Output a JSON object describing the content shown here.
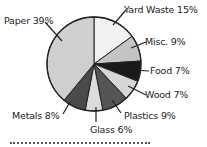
{
  "chart_data": {
    "type": "pie",
    "title": "",
    "categories": [
      "Yard Waste",
      "Misc.",
      "Food",
      "Wood",
      "Plastics",
      "Glass",
      "Metals",
      "Paper"
    ],
    "values": [
      15,
      9,
      7,
      7,
      9,
      6,
      8,
      39
    ],
    "colors": [
      "#f2f2f2",
      "#c4c4c4",
      "#1a1a1a",
      "#d6d6d6",
      "#555555",
      "#dcdcdc",
      "#4a4a4a",
      "#cfcfcf"
    ],
    "start_angle_deg": 0,
    "direction": "clockwise",
    "legend": "none",
    "labels": [
      "Yard Waste 15%",
      "Misc. 9%",
      "Food 7%",
      "Wood 7%",
      "Plastics 9%",
      "Glass 6%",
      "Metals 8%",
      "Paper 39%"
    ]
  },
  "geometry": {
    "cx": 94,
    "cy": 64,
    "r": 47
  },
  "label_positions": [
    {
      "x": 124,
      "y": 4,
      "lx1": 113,
      "ly1": 25,
      "lx2": 126,
      "ly2": 10
    },
    {
      "x": 145,
      "y": 36,
      "lx1": 131,
      "ly1": 48,
      "lx2": 146,
      "ly2": 42
    },
    {
      "x": 150,
      "y": 65,
      "lx1": 133,
      "ly1": 70,
      "lx2": 149,
      "ly2": 71
    },
    {
      "x": 145,
      "y": 89,
      "lx1": 128,
      "ly1": 86,
      "lx2": 146,
      "ly2": 95
    },
    {
      "x": 124,
      "y": 110,
      "lx1": 112,
      "ly1": 100,
      "lx2": 121,
      "ly2": 113
    },
    {
      "x": 90,
      "y": 124,
      "lx1": 96,
      "ly1": 107,
      "lx2": 96,
      "ly2": 122
    },
    {
      "x": 12,
      "y": 110,
      "lx1": 70,
      "ly1": 102,
      "lx2": 63,
      "ly2": 114
    },
    {
      "x": 4,
      "y": 15,
      "lx1": 62,
      "ly1": 41,
      "lx2": 45,
      "ly2": 22
    }
  ],
  "footer_cut_text": ""
}
